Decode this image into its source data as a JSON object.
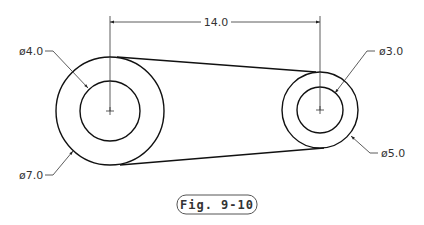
{
  "figure": {
    "caption": "Fig. 9-10"
  },
  "dimensions": {
    "center_distance": "14.0",
    "left_inner_diameter": "ø4.0",
    "left_outer_diameter": "ø7.0",
    "right_inner_diameter": "ø3.0",
    "right_outer_diameter": "ø5.0"
  },
  "geometry": {
    "left_center": [
      110,
      111
    ],
    "left_outer_r": 54,
    "left_inner_r": 30,
    "right_center": [
      320,
      110
    ],
    "right_outer_r": 38,
    "right_inner_r": 23
  },
  "colors": {
    "line": "#111111",
    "dim_line": "#333333",
    "text": "#333333"
  }
}
